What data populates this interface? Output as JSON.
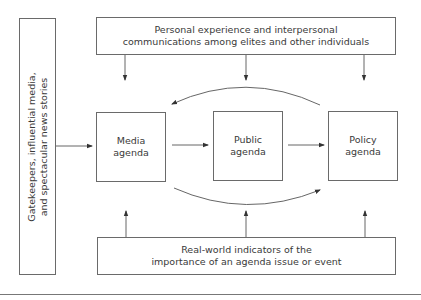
{
  "diagram": {
    "left_box": {
      "line1": "Gatekeepers, influential media,",
      "line2": "and spectacular news stories"
    },
    "top_box": {
      "line1": "Personal experience and interpersonal",
      "line2": "communications among elites and other individuals"
    },
    "bottom_box": {
      "line1": "Real-world indicators of the",
      "line2": "importance of an agenda issue or event"
    },
    "nodes": [
      {
        "line1": "Media",
        "line2": "agenda"
      },
      {
        "line1": "Public",
        "line2": "agenda"
      },
      {
        "line1": "Policy",
        "line2": "agenda"
      }
    ],
    "colors": {
      "line": "#6a6a6a",
      "text": "#3a3a3a",
      "background": "#ffffff"
    }
  }
}
